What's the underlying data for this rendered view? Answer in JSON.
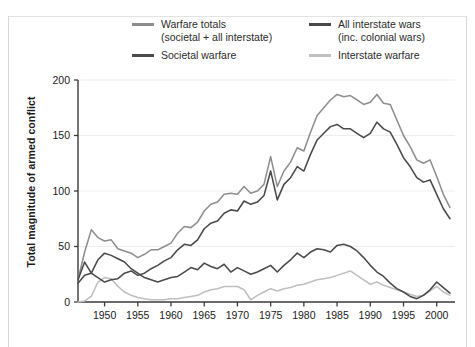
{
  "colors": {
    "totals": "#8e8e8e",
    "societal": "#4a4a4a",
    "all_interstate": "#5a5a5a",
    "interstate": "#bfbfbf",
    "axis": "#3a3a3a",
    "grid": "#ededed",
    "background": "#ffffff"
  },
  "legend": {
    "items": [
      {
        "name": "warfare-totals",
        "label": "Warfare totals",
        "sublabel": "(societal  +  all interstate)",
        "color": "#8e8e8e"
      },
      {
        "name": "all-interstate-wars",
        "label": "All interstate wars",
        "sublabel": "(inc. colonial wars)",
        "color": "#4a4a4a"
      },
      {
        "name": "societal-warfare",
        "label": "Societal warfare",
        "sublabel": "",
        "color": "#4a4a4a"
      },
      {
        "name": "interstate-warfare",
        "label": "Interstate warfare",
        "sublabel": "",
        "color": "#bfbfbf"
      }
    ]
  },
  "axes": {
    "ylabel": "Total magnitude of armed conflict",
    "xlabel": "",
    "yticks": [
      "0",
      "50",
      "100",
      "150",
      "200"
    ],
    "xticks": [
      "1950",
      "1955",
      "1960",
      "1965",
      "1970",
      "1975",
      "1980",
      "1985",
      "1990",
      "1995",
      "2000"
    ],
    "ylim": [
      0,
      200
    ],
    "xlim": [
      1946,
      2002
    ],
    "grid": "horizontal-faint"
  },
  "chart_data": {
    "type": "line",
    "title": "",
    "xlabel": "",
    "ylabel": "Total magnitude of armed conflict",
    "xlim": [
      1946,
      2002
    ],
    "ylim": [
      0,
      200
    ],
    "grid": true,
    "legend_position": "top",
    "x": [
      1946,
      1947,
      1948,
      1949,
      1950,
      1951,
      1952,
      1953,
      1954,
      1955,
      1956,
      1957,
      1958,
      1959,
      1960,
      1961,
      1962,
      1963,
      1964,
      1965,
      1966,
      1967,
      1968,
      1969,
      1970,
      1971,
      1972,
      1973,
      1974,
      1975,
      1976,
      1977,
      1978,
      1979,
      1980,
      1981,
      1982,
      1983,
      1984,
      1985,
      1986,
      1987,
      1988,
      1989,
      1990,
      1991,
      1992,
      1993,
      1994,
      1995,
      1996,
      1997,
      1998,
      1999,
      2000,
      2001,
      2002
    ],
    "series": [
      {
        "name": "Warfare totals (societal + all interstate)",
        "color": "#8e8e8e",
        "values": [
          20,
          45,
          65,
          58,
          55,
          56,
          48,
          46,
          44,
          40,
          43,
          47,
          47,
          50,
          53,
          62,
          68,
          67,
          72,
          82,
          88,
          90,
          97,
          98,
          97,
          104,
          98,
          100,
          106,
          131,
          104,
          118,
          126,
          139,
          136,
          153,
          168,
          175,
          182,
          187,
          185,
          186,
          182,
          178,
          180,
          187,
          179,
          178,
          164,
          150,
          140,
          128,
          125,
          128,
          113,
          97,
          85
        ]
      },
      {
        "name": "Societal warfare",
        "color": "#4a4a4a",
        "values": [
          17,
          24,
          26,
          22,
          18,
          20,
          21,
          26,
          28,
          24,
          26,
          30,
          33,
          37,
          40,
          47,
          52,
          51,
          56,
          66,
          71,
          73,
          80,
          83,
          82,
          91,
          88,
          90,
          96,
          118,
          92,
          106,
          112,
          122,
          118,
          133,
          146,
          152,
          158,
          160,
          156,
          156,
          152,
          148,
          152,
          162,
          156,
          153,
          142,
          130,
          122,
          112,
          108,
          110,
          97,
          84,
          75
        ]
      },
      {
        "name": "All interstate wars (inc. colonial wars)",
        "color": "#4a4a4a",
        "values": [
          20,
          36,
          26,
          38,
          44,
          42,
          39,
          36,
          30,
          26,
          22,
          20,
          18,
          20,
          22,
          23,
          27,
          31,
          29,
          35,
          32,
          30,
          34,
          27,
          31,
          28,
          25,
          27,
          30,
          33,
          27,
          33,
          38,
          44,
          40,
          45,
          48,
          47,
          45,
          51,
          52,
          50,
          46,
          40,
          33,
          27,
          23,
          17,
          12,
          9,
          5,
          3,
          6,
          11,
          18,
          13,
          8
        ]
      },
      {
        "name": "Interstate warfare",
        "color": "#bfbfbf",
        "values": [
          0,
          1,
          5,
          18,
          22,
          21,
          14,
          9,
          6,
          4,
          3,
          2,
          2,
          2,
          3,
          3,
          4,
          5,
          6,
          9,
          11,
          12,
          14,
          14,
          14,
          11,
          2,
          6,
          9,
          12,
          10,
          12,
          13,
          15,
          16,
          18,
          20,
          21,
          22,
          24,
          26,
          28,
          24,
          20,
          16,
          18,
          15,
          13,
          11,
          9,
          7,
          5,
          6,
          10,
          14,
          9,
          6
        ]
      }
    ]
  }
}
